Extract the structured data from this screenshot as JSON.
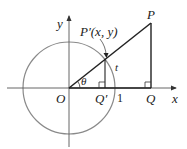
{
  "diagram": {
    "labels": {
      "y_axis": "y",
      "x_axis": "x",
      "origin": "O",
      "point_P": "P",
      "point_P_prime": "P′(x, y)",
      "point_Q": "Q",
      "point_Q_prime": "Q′",
      "unit_mark": "1",
      "angle": "θ",
      "arc": "t"
    },
    "colors": {
      "circle": "#8a8a8a",
      "axes": "#555555",
      "lines": "#222222"
    }
  }
}
